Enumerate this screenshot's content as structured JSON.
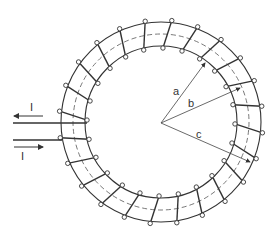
{
  "diagram": {
    "labels": {
      "radius_a": "a",
      "radius_b": "b",
      "radius_c": "c",
      "current_in": "I",
      "current_out": "I"
    },
    "geometry": {
      "center": [
        161,
        122
      ],
      "outer_radius": 100,
      "mid_radius": 88,
      "inner_radius": 76,
      "winding_count": 24
    },
    "colors": {
      "stroke": "#333333",
      "background": "#ffffff"
    }
  }
}
